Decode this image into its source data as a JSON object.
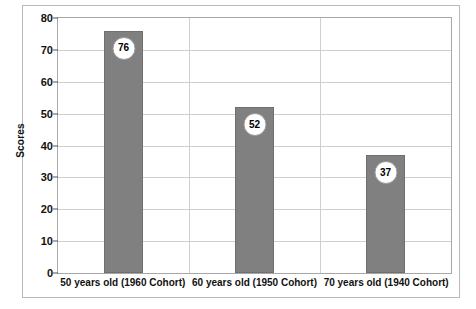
{
  "chart_data": {
    "type": "bar",
    "title": "",
    "subtitle": "",
    "xlabel": "",
    "ylabel": "Scores",
    "categories": [
      "50 years old (1960 Cohort)",
      "60 years old (1950 Cohort)",
      "70 years old (1940 Cohort)"
    ],
    "values": [
      76,
      52,
      37
    ],
    "value_labels": [
      "76",
      "52",
      "37"
    ],
    "ylim": [
      0,
      80
    ],
    "ytick_step": 10,
    "yticks": [
      80,
      70,
      60,
      50,
      40,
      30,
      20,
      10,
      0
    ],
    "ytick_labels": [
      "80",
      "70",
      "60",
      "50",
      "40",
      "30",
      "20",
      "10",
      "0"
    ],
    "grid": {
      "horizontal": true,
      "vertical": true,
      "color": "#cfcfcf"
    },
    "legend": {
      "visible": false,
      "position": "none",
      "entries": []
    },
    "series": [
      {
        "name": "Scores",
        "values": [
          76,
          52,
          37
        ],
        "color": "#808080"
      }
    ],
    "colors": {
      "bar_fill": "#808080",
      "bar_border": "#6f6f6f",
      "badge_fill": "#ffffff",
      "badge_border": "#9a9a9a",
      "badge_text": "#000000",
      "axis_text": "#111111",
      "plot_border": "#a8a8a8",
      "figure_border": "#b9b9b9",
      "background": "#ffffff"
    }
  }
}
